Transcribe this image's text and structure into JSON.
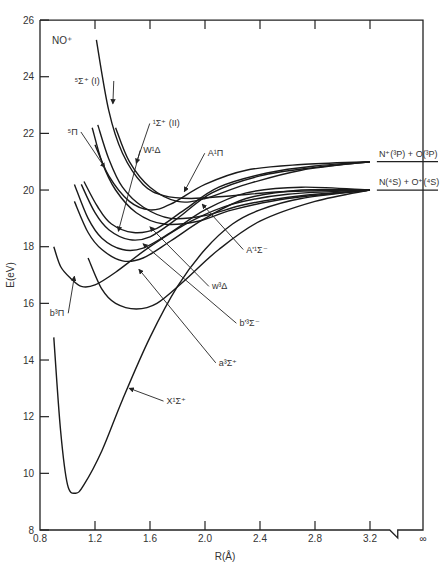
{
  "chart_data": {
    "type": "line",
    "xlabel": "R(Å)",
    "ylabel": "E(eV)",
    "xlim": [
      0.8,
      3.2
    ],
    "ylim": [
      8,
      26
    ],
    "x_ticks": [
      "0.8",
      "1.2",
      "1.6",
      "2.0",
      "2.4",
      "2.8",
      "3.2",
      "∞"
    ],
    "y_ticks": [
      "8",
      "10",
      "12",
      "14",
      "16",
      "18",
      "20",
      "22",
      "24",
      "26"
    ],
    "grid": false,
    "asymptotes": [
      {
        "label": "N⁺(³P) + O(³P)",
        "energy": 21.0
      },
      {
        "label": "N(⁴S) + O⁺(⁴S)",
        "energy": 20.0
      }
    ],
    "series": [
      {
        "name": "X¹Σ⁺",
        "points": [
          [
            0.9,
            14.8
          ],
          [
            0.95,
            11.5
          ],
          [
            1.0,
            9.6
          ],
          [
            1.06,
            9.3
          ],
          [
            1.12,
            9.6
          ],
          [
            1.25,
            10.8
          ],
          [
            1.4,
            12.6
          ],
          [
            1.6,
            14.8
          ],
          [
            1.8,
            16.6
          ],
          [
            2.0,
            17.9
          ],
          [
            2.2,
            18.8
          ],
          [
            2.4,
            19.3
          ],
          [
            2.7,
            19.7
          ],
          [
            3.2,
            20.0
          ]
        ]
      },
      {
        "name": "b³Π",
        "points": [
          [
            0.9,
            18.0
          ],
          [
            0.95,
            17.3
          ],
          [
            1.02,
            16.9
          ],
          [
            1.1,
            16.6
          ],
          [
            1.2,
            16.65
          ],
          [
            1.35,
            17.1
          ],
          [
            1.6,
            18.0
          ],
          [
            1.9,
            18.9
          ],
          [
            2.2,
            19.5
          ],
          [
            2.6,
            19.85
          ],
          [
            3.2,
            20.0
          ]
        ]
      },
      {
        "name": "a³Σ⁺",
        "points": [
          [
            1.15,
            17.6
          ],
          [
            1.25,
            16.5
          ],
          [
            1.35,
            16.0
          ],
          [
            1.5,
            15.8
          ],
          [
            1.65,
            16.0
          ],
          [
            1.85,
            16.8
          ],
          [
            2.1,
            17.9
          ],
          [
            2.4,
            18.9
          ],
          [
            2.8,
            19.6
          ],
          [
            3.2,
            20.0
          ]
        ]
      },
      {
        "name": "b'³Σ⁻",
        "points": [
          [
            1.05,
            19.6
          ],
          [
            1.15,
            18.5
          ],
          [
            1.25,
            17.9
          ],
          [
            1.4,
            17.5
          ],
          [
            1.55,
            17.6
          ],
          [
            1.75,
            18.2
          ],
          [
            2.0,
            19.0
          ],
          [
            2.3,
            19.7
          ],
          [
            2.7,
            20.0
          ],
          [
            3.2,
            20.0
          ]
        ]
      },
      {
        "name": "w³Δ",
        "points": [
          [
            1.05,
            20.2
          ],
          [
            1.15,
            19.0
          ],
          [
            1.25,
            18.3
          ],
          [
            1.4,
            17.9
          ],
          [
            1.55,
            17.95
          ],
          [
            1.75,
            18.5
          ],
          [
            2.0,
            19.3
          ],
          [
            2.3,
            19.9
          ],
          [
            2.7,
            20.1
          ],
          [
            3.2,
            20.0
          ]
        ]
      },
      {
        "name": "A'¹Σ⁻",
        "points": [
          [
            1.1,
            20.2
          ],
          [
            1.2,
            19.2
          ],
          [
            1.3,
            18.6
          ],
          [
            1.45,
            18.25
          ],
          [
            1.6,
            18.35
          ],
          [
            1.8,
            19.0
          ],
          [
            2.05,
            19.9
          ],
          [
            2.4,
            20.5
          ],
          [
            2.8,
            20.8
          ],
          [
            3.2,
            21.0
          ]
        ]
      },
      {
        "name": "W¹Δ",
        "points": [
          [
            1.12,
            20.3
          ],
          [
            1.22,
            19.4
          ],
          [
            1.32,
            18.8
          ],
          [
            1.48,
            18.5
          ],
          [
            1.65,
            18.65
          ],
          [
            1.85,
            19.3
          ],
          [
            2.1,
            20.1
          ],
          [
            2.45,
            20.6
          ],
          [
            2.8,
            20.85
          ],
          [
            3.2,
            21.0
          ]
        ]
      },
      {
        "name": "A¹Π",
        "points": [
          [
            1.2,
            21.6
          ],
          [
            1.3,
            20.5
          ],
          [
            1.45,
            19.6
          ],
          [
            1.6,
            19.3
          ],
          [
            1.75,
            19.5
          ],
          [
            2.0,
            20.2
          ],
          [
            2.3,
            20.7
          ],
          [
            2.7,
            20.9
          ],
          [
            3.2,
            21.0
          ]
        ]
      },
      {
        "name": "⁵Π",
        "points": [
          [
            1.18,
            22.2
          ],
          [
            1.25,
            21.0
          ],
          [
            1.35,
            20.0
          ],
          [
            1.5,
            19.2
          ],
          [
            1.7,
            18.8
          ],
          [
            1.95,
            18.9
          ],
          [
            2.2,
            19.3
          ],
          [
            2.6,
            19.7
          ],
          [
            3.2,
            20.0
          ]
        ]
      },
      {
        "name": "⁵Π-b",
        "points": [
          [
            1.22,
            22.3
          ],
          [
            1.3,
            21.1
          ],
          [
            1.4,
            20.1
          ],
          [
            1.55,
            19.4
          ],
          [
            1.75,
            19.0
          ],
          [
            2.0,
            19.1
          ],
          [
            2.3,
            19.5
          ],
          [
            2.7,
            19.8
          ],
          [
            3.2,
            20.0
          ]
        ]
      },
      {
        "name": "¹Σ⁺ (II)",
        "points": [
          [
            1.35,
            22.2
          ],
          [
            1.45,
            21.0
          ],
          [
            1.6,
            20.1
          ],
          [
            1.8,
            19.6
          ],
          [
            2.0,
            19.7
          ],
          [
            2.3,
            20.2
          ],
          [
            2.7,
            20.7
          ],
          [
            3.2,
            21.0
          ]
        ]
      },
      {
        "name": "⁵Σ⁺ (I)",
        "points": [
          [
            1.21,
            25.3
          ],
          [
            1.3,
            22.8
          ],
          [
            1.4,
            21.3
          ],
          [
            1.55,
            20.2
          ],
          [
            1.7,
            19.8
          ],
          [
            1.9,
            19.7
          ],
          [
            2.2,
            19.8
          ],
          [
            2.6,
            19.95
          ],
          [
            3.2,
            20.0
          ]
        ]
      }
    ],
    "annotations": [
      {
        "label": "⁵Σ⁺ (I)",
        "text_at": [
          1.05,
          23.85
        ],
        "arrow_to": [
          1.33,
          23.05
        ]
      },
      {
        "label": "¹Σ⁺ (II)",
        "text_at": [
          1.62,
          22.35
        ],
        "arrow_to": [
          1.5,
          20.95
        ]
      },
      {
        "label": "⁵Π",
        "text_at": [
          1.0,
          22.05
        ],
        "arrow_to": [
          1.27,
          20.8
        ]
      },
      {
        "label": "W¹Δ",
        "text_at": [
          1.55,
          21.4
        ],
        "arrow_to": [
          1.37,
          18.55
        ]
      },
      {
        "label": "A¹Π",
        "text_at": [
          2.02,
          21.3
        ],
        "arrow_to": [
          1.85,
          19.95
        ]
      },
      {
        "label": "A'¹Σ⁻",
        "text_at": [
          2.3,
          17.9
        ],
        "arrow_to": [
          1.98,
          19.5
        ]
      },
      {
        "label": "w³Δ",
        "text_at": [
          2.05,
          16.6
        ],
        "arrow_to": [
          1.6,
          18.7
        ]
      },
      {
        "label": "b'³Σ⁻",
        "text_at": [
          2.25,
          15.3
        ],
        "arrow_to": [
          1.55,
          18.1
        ]
      },
      {
        "label": "a³Σ⁺",
        "text_at": [
          2.1,
          13.9
        ],
        "arrow_to": [
          1.52,
          17.2
        ]
      },
      {
        "label": "X¹Σ⁺",
        "text_at": [
          1.72,
          12.55
        ],
        "arrow_to": [
          1.45,
          13.0
        ]
      },
      {
        "label": "b³Π",
        "text_at": [
          0.87,
          15.65
        ],
        "arrow_to": [
          1.05,
          16.95
        ]
      }
    ]
  },
  "labels": {
    "species": "NO⁺",
    "ylabel": "E(eV)",
    "xlabel": "R(Å)",
    "infinity": "∞"
  }
}
